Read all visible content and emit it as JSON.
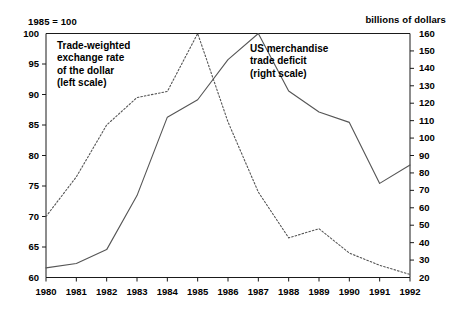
{
  "figure": {
    "left_units": "1985 = 100",
    "right_units": "billions of dollars",
    "legend_left": {
      "line1": "Trade-weighted",
      "line2": "exchange rate",
      "line3": "of the dollar",
      "line4": "(left scale)"
    },
    "legend_right": {
      "line1": "US merchandise",
      "line2": "trade deficit",
      "line3": "(right scale)"
    }
  },
  "chart_data": {
    "type": "line",
    "title": "",
    "subtitle": "",
    "xlabel": "",
    "ylabel": "1985 = 100",
    "y2label": "billions of dollars",
    "grid": false,
    "legend_position": "inside-plot-annotations",
    "x": [
      1980,
      1981,
      1982,
      1983,
      1984,
      1985,
      1986,
      1987,
      1988,
      1989,
      1990,
      1991,
      1992
    ],
    "xtick_labels": [
      "1980",
      "1981",
      "1982",
      "1983",
      "1984",
      "1985",
      "1986",
      "1987",
      "1988",
      "1989",
      "1990",
      "1991",
      "1992"
    ],
    "ylim": [
      60,
      100
    ],
    "ytick_labels": [
      "60",
      "65",
      "70",
      "75",
      "80",
      "85",
      "90",
      "95",
      "100"
    ],
    "yticks": [
      60,
      65,
      70,
      75,
      80,
      85,
      90,
      95,
      100
    ],
    "y2lim": [
      20,
      160
    ],
    "y2tick_labels": [
      "20",
      "30",
      "40",
      "50",
      "60",
      "70",
      "80",
      "90",
      "100",
      "110",
      "120",
      "130",
      "140",
      "150",
      "160"
    ],
    "y2ticks": [
      20,
      30,
      40,
      50,
      60,
      70,
      80,
      90,
      100,
      110,
      120,
      130,
      140,
      150,
      160
    ],
    "series": [
      {
        "name": "Trade-weighted exchange rate of the dollar (left scale)",
        "axis": "left",
        "style": "dotted",
        "color": "#555555",
        "values": [
          70.0,
          76.5,
          85.0,
          89.5,
          90.5,
          100.0,
          85.5,
          74.0,
          66.5,
          68.0,
          64.0,
          62.0,
          60.5
        ]
      },
      {
        "name": "US merchandise trade deficit (right scale)",
        "axis": "right",
        "style": "solid",
        "color": "#555555",
        "values": [
          25.5,
          28.0,
          36.0,
          67.0,
          112.0,
          122.0,
          145.0,
          160.0,
          127.0,
          115.0,
          109.0,
          74.0,
          84.5
        ]
      }
    ]
  }
}
